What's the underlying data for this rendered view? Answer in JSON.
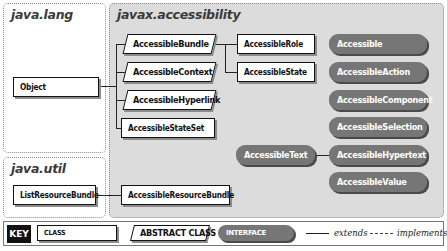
{
  "packages": {
    "java_lang": {
      "title": "java.lang"
    },
    "java_util": {
      "title": "java.util"
    },
    "javax_accessibility": {
      "title": "javax.accessibility"
    }
  },
  "classes": {
    "object": {
      "name": "Object",
      "kind": "class",
      "package": "java.lang"
    },
    "list_resource_bundle": {
      "name": "ListResourceBundle",
      "kind": "class",
      "package": "java.util"
    },
    "accessible_bundle": {
      "name": "AccessibleBundle",
      "kind": "abstract class",
      "package": "javax.accessibility"
    },
    "accessible_context": {
      "name": "AccessibleContext",
      "kind": "abstract class",
      "package": "javax.accessibility"
    },
    "accessible_hyperlink": {
      "name": "AccessibleHyperlink",
      "kind": "abstract class",
      "package": "javax.accessibility"
    },
    "accessible_state_set": {
      "name": "AccessibleStateSet",
      "kind": "class",
      "package": "javax.accessibility"
    },
    "accessible_role": {
      "name": "AccessibleRole",
      "kind": "class",
      "package": "javax.accessibility"
    },
    "accessible_state": {
      "name": "AccessibleState",
      "kind": "class",
      "package": "javax.accessibility"
    },
    "accessible_resource_bundle": {
      "name": "AccessibleResourceBundle",
      "kind": "class",
      "package": "javax.accessibility"
    }
  },
  "interfaces": {
    "accessible": {
      "name": "Accessible"
    },
    "accessible_action": {
      "name": "AccessibleAction"
    },
    "accessible_component": {
      "name": "AccessibleComponent"
    },
    "accessible_selection": {
      "name": "AccessibleSelection"
    },
    "accessible_text": {
      "name": "AccessibleText"
    },
    "accessible_hypertext": {
      "name": "AccessibleHypertext"
    },
    "accessible_value": {
      "name": "AccessibleValue"
    }
  },
  "relations": [
    {
      "from": "AccessibleBundle",
      "to": "Object",
      "type": "extends"
    },
    {
      "from": "AccessibleContext",
      "to": "Object",
      "type": "extends"
    },
    {
      "from": "AccessibleHyperlink",
      "to": "Object",
      "type": "extends"
    },
    {
      "from": "AccessibleStateSet",
      "to": "Object",
      "type": "extends"
    },
    {
      "from": "AccessibleRole",
      "to": "AccessibleBundle",
      "type": "extends"
    },
    {
      "from": "AccessibleState",
      "to": "AccessibleBundle",
      "type": "extends"
    },
    {
      "from": "AccessibleResourceBundle",
      "to": "ListResourceBundle",
      "type": "extends"
    },
    {
      "from": "AccessibleHypertext",
      "to": "AccessibleText",
      "type": "extends"
    }
  ],
  "key": {
    "label": "KEY",
    "class": "CLASS",
    "abstract_class": "ABSTRACT CLASS",
    "interface": "INTERFACE",
    "extends": "extends",
    "implements": "implements"
  }
}
